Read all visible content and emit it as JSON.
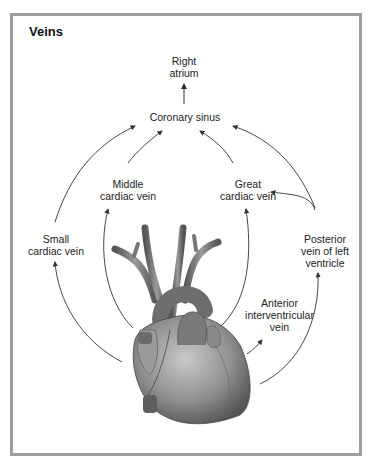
{
  "title": "Veins",
  "labels": {
    "right_atrium": "Right\natrium",
    "coronary_sinus": "Coronary sinus",
    "middle_cardiac_vein": "Middle\ncardiac vein",
    "great_cardiac_vein": "Great\ncardiac vein",
    "small_cardiac_vein": "Small\ncardiac vein",
    "posterior_vein_left_ventricle": "Posterior\nvein of left\nventricle",
    "anterior_interventricular_vein": "Anterior\ninterventricular\nvein"
  },
  "colors": {
    "border": "#9e9e9e",
    "arrow": "#333333",
    "heart_dark": "#5a5a5a",
    "heart_mid": "#8a8a8a",
    "heart_light": "#b8b8b8"
  }
}
